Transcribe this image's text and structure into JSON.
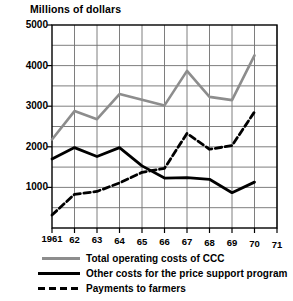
{
  "chart_data": {
    "type": "line",
    "title": "Millions of dollars",
    "xlabel": "",
    "ylabel": "Millions of dollars",
    "grid": true,
    "legend_position": "below",
    "x": [
      "1961",
      "62",
      "63",
      "64",
      "65",
      "66",
      "67",
      "68",
      "69",
      "70",
      "71"
    ],
    "categories": [
      "1961",
      "62",
      "63",
      "64",
      "65",
      "66",
      "67",
      "68",
      "69",
      "70",
      "71"
    ],
    "xlim": [
      1961,
      1971
    ],
    "ylim": [
      0,
      5000
    ],
    "ytick_labels": [
      "5000",
      "4000",
      "3000",
      "2000",
      "1000"
    ],
    "ytick_values": [
      5000,
      4000,
      3000,
      2000,
      1000
    ],
    "gridline_step": 500,
    "series": [
      {
        "name": "Total operating costs of CCC",
        "style": "solid-gray",
        "color": "#8d8d8d",
        "x": [
          1961,
          1962,
          1963,
          1964,
          1965,
          1966,
          1967,
          1968,
          1969,
          1970
        ],
        "values": [
          2180,
          2880,
          2680,
          3300,
          3160,
          3020,
          3870,
          3230,
          3150,
          4250
        ]
      },
      {
        "name": "Other costs for the price support program",
        "style": "solid-black",
        "color": "#000000",
        "x": [
          1961,
          1962,
          1963,
          1964,
          1965,
          1966,
          1967,
          1968,
          1969,
          1970
        ],
        "values": [
          1700,
          1980,
          1760,
          1980,
          1530,
          1230,
          1240,
          1200,
          870,
          1130
        ]
      },
      {
        "name": "Payments to farmers",
        "style": "dashed-black",
        "color": "#000000",
        "x": [
          1961,
          1962,
          1963,
          1964,
          1965,
          1966,
          1967,
          1968,
          1969,
          1970
        ],
        "values": [
          320,
          830,
          900,
          1110,
          1370,
          1470,
          2330,
          1940,
          2030,
          2860
        ]
      }
    ]
  },
  "legend": {
    "items": [
      {
        "label": "Total operating costs of CCC",
        "swatch": "solid-gray-line-icon"
      },
      {
        "label": "Other costs for the price support program",
        "swatch": "solid-black-line-icon"
      },
      {
        "label": "Payments to farmers",
        "swatch": "dashed-black-line-icon"
      }
    ]
  }
}
